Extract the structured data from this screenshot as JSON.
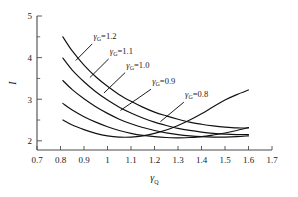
{
  "chart_data": {
    "type": "line",
    "title": "",
    "subtitle": "",
    "xlabel": "γQ",
    "ylabel": "I",
    "xlabel_base": "γ",
    "xlabel_sub": "Q",
    "xlim": [
      0.7,
      1.7
    ],
    "ylim": [
      1.78,
      5.0
    ],
    "grid": false,
    "legend_position": "inline-annotations",
    "xticks": [
      0.7,
      0.8,
      0.9,
      1.0,
      1.1,
      1.2,
      1.3,
      1.4,
      1.5,
      1.6,
      1.7
    ],
    "xtick_labels": [
      "0.7",
      "0.8",
      "0.9",
      "1",
      "1.1",
      "1.2",
      "1.3",
      "1.4",
      "1.5",
      "1.6",
      "1.7"
    ],
    "yticks": [
      2,
      3,
      4,
      5
    ],
    "ytick_labels": [
      "2",
      "3",
      "4",
      "5"
    ],
    "yminor_ticks": [
      2.5,
      3.5,
      4.5
    ],
    "annotations": [
      {
        "text": "γG=1.2",
        "base": "γ",
        "sub": "G",
        "rest": "=1.2",
        "x": 0.94,
        "y": 4.45
      },
      {
        "text": "γG=1.1",
        "base": "γ",
        "sub": "G",
        "rest": "=1.1",
        "x": 1.01,
        "y": 4.09
      },
      {
        "text": "γG=1.0",
        "base": "γ",
        "sub": "G",
        "rest": "=1.0",
        "x": 1.08,
        "y": 3.76
      },
      {
        "text": "γG=0.9",
        "base": "γ",
        "sub": "G",
        "rest": "=0.9",
        "x": 1.19,
        "y": 3.36
      },
      {
        "text": "γG=0.8",
        "base": "γ",
        "sub": "G",
        "rest": "=0.8",
        "x": 1.33,
        "y": 3.05
      }
    ],
    "series": [
      {
        "name": "γG=1.2",
        "gamma_g": 1.2,
        "x": [
          0.81,
          0.85,
          0.9,
          0.95,
          1.0,
          1.05,
          1.1,
          1.15,
          1.2,
          1.25,
          1.3,
          1.35,
          1.4,
          1.45,
          1.5,
          1.55,
          1.6
        ],
        "values": [
          4.5,
          4.16,
          3.82,
          3.54,
          3.31,
          3.11,
          2.95,
          2.81,
          2.69,
          2.6,
          2.52,
          2.45,
          2.4,
          2.36,
          2.33,
          2.31,
          2.31
        ]
      },
      {
        "name": "γG=1.1",
        "gamma_g": 1.1,
        "x": [
          0.81,
          0.85,
          0.9,
          0.95,
          1.0,
          1.05,
          1.1,
          1.15,
          1.2,
          1.25,
          1.3,
          1.35,
          1.4,
          1.45,
          1.5,
          1.55,
          1.6
        ],
        "values": [
          3.99,
          3.7,
          3.42,
          3.18,
          2.98,
          2.81,
          2.67,
          2.55,
          2.45,
          2.37,
          2.3,
          2.25,
          2.21,
          2.18,
          2.16,
          2.15,
          2.15
        ]
      },
      {
        "name": "γG=1.0",
        "gamma_g": 1.0,
        "x": [
          0.81,
          0.85,
          0.9,
          0.95,
          1.0,
          1.05,
          1.1,
          1.15,
          1.2,
          1.25,
          1.3,
          1.35,
          1.4,
          1.45,
          1.5,
          1.55,
          1.6
        ],
        "values": [
          3.45,
          3.23,
          3.01,
          2.82,
          2.66,
          2.52,
          2.41,
          2.32,
          2.25,
          2.19,
          2.15,
          2.12,
          2.1,
          2.09,
          2.09,
          2.1,
          2.12
        ]
      },
      {
        "name": "γG=0.9",
        "gamma_g": 0.9,
        "x": [
          0.81,
          0.85,
          0.9,
          0.95,
          1.0,
          1.05,
          1.1,
          1.15,
          1.2,
          1.25,
          1.3,
          1.35,
          1.4,
          1.45,
          1.5,
          1.55,
          1.6
        ],
        "values": [
          2.9,
          2.74,
          2.58,
          2.45,
          2.34,
          2.25,
          2.18,
          2.13,
          2.1,
          2.08,
          2.07,
          2.08,
          2.1,
          2.14,
          2.19,
          2.25,
          2.32
        ]
      },
      {
        "name": "γG=0.8",
        "gamma_g": 0.8,
        "x": [
          0.81,
          0.85,
          0.9,
          0.95,
          1.0,
          1.05,
          1.1,
          1.15,
          1.2,
          1.25,
          1.3,
          1.35,
          1.4,
          1.45,
          1.5,
          1.55,
          1.6
        ],
        "values": [
          2.5,
          2.38,
          2.27,
          2.18,
          2.12,
          2.09,
          2.09,
          2.12,
          2.18,
          2.26,
          2.37,
          2.5,
          2.65,
          2.82,
          2.98,
          3.11,
          3.22
        ]
      }
    ],
    "leaders": [
      {
        "name": "leader-1.2",
        "x1": 0.935,
        "y1": 4.33,
        "x2": 0.865,
        "y2": 3.93
      },
      {
        "name": "leader-1.1",
        "x1": 1.005,
        "y1": 3.97,
        "x2": 0.925,
        "y2": 3.52
      },
      {
        "name": "leader-1.0",
        "x1": 1.075,
        "y1": 3.64,
        "x2": 0.985,
        "y2": 3.15
      },
      {
        "name": "leader-0.9",
        "x1": 1.185,
        "y1": 3.24,
        "x2": 1.055,
        "y2": 2.73
      },
      {
        "name": "leader-0.8",
        "x1": 1.325,
        "y1": 2.93,
        "x2": 1.225,
        "y2": 2.46
      }
    ]
  }
}
